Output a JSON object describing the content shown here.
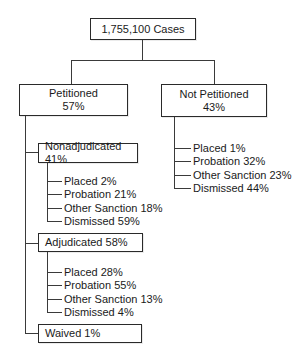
{
  "root": {
    "label": "1,755,100 Cases"
  },
  "petitioned": {
    "label": "Petitioned",
    "percent": "57%",
    "children": {
      "nonadjudicated": {
        "label": "Nonadjudicated 41%",
        "items": [
          {
            "label": "Placed 2%"
          },
          {
            "label": "Probation 21%"
          },
          {
            "label": "Other Sanction 18%"
          },
          {
            "label": "Dismissed 59%"
          }
        ]
      },
      "adjudicated": {
        "label": "Adjudicated 58%",
        "items": [
          {
            "label": "Placed 28%"
          },
          {
            "label": "Probation 55%"
          },
          {
            "label": "Other Sanction 13%"
          },
          {
            "label": "Dismissed 4%"
          }
        ]
      },
      "waived": {
        "label": "Waived 1%"
      }
    }
  },
  "not_petitioned": {
    "label": "Not Petitioned",
    "percent": "43%",
    "items": [
      {
        "label": "Placed 1%"
      },
      {
        "label": "Probation 32%"
      },
      {
        "label": "Other Sanction 23%"
      },
      {
        "label": "Dismissed 44%"
      }
    ]
  }
}
